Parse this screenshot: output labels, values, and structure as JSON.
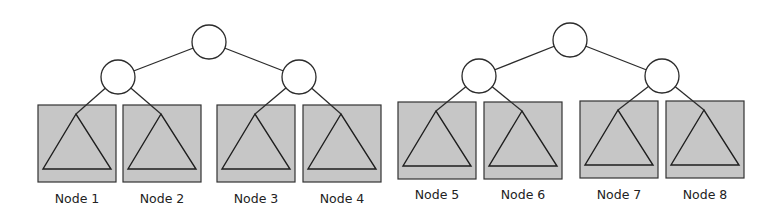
{
  "diagram": {
    "type": "tree-partition",
    "colors": {
      "leaf_fill": "#c6c6c6",
      "stroke": "#2b2b2b",
      "node_fill": "#ffffff"
    },
    "trees": [
      {
        "root": "r",
        "children": [
          "l",
          "r"
        ],
        "leaves": [
          {
            "label": "Node 1"
          },
          {
            "label": "Node 2"
          },
          {
            "label": "Node 3"
          },
          {
            "label": "Node 4"
          }
        ]
      },
      {
        "root": "r",
        "children": [
          "l",
          "r"
        ],
        "leaves": [
          {
            "label": "Node 5"
          },
          {
            "label": "Node 6"
          },
          {
            "label": "Node 7"
          },
          {
            "label": "Node 8"
          }
        ]
      }
    ]
  }
}
